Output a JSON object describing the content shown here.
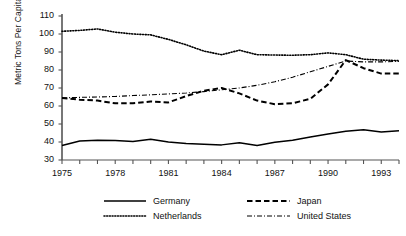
{
  "chart_data": {
    "type": "line",
    "title": "",
    "xlabel": "",
    "ylabel": "Metric Tons Per Capita",
    "xlim": [
      1975,
      1994
    ],
    "ylim": [
      30,
      110
    ],
    "ytick_values": [
      30,
      40,
      50,
      60,
      70,
      80,
      90,
      100,
      110
    ],
    "ytick_labels": [
      "30",
      "40",
      "50",
      "60",
      "70",
      "80",
      "90",
      "100",
      "110"
    ],
    "xtick_values": [
      1975,
      1976,
      1977,
      1978,
      1979,
      1980,
      1981,
      1982,
      1983,
      1984,
      1985,
      1986,
      1987,
      1988,
      1989,
      1990,
      1991,
      1992,
      1993,
      1994
    ],
    "xtick_labels": [
      "1975",
      "",
      "",
      "1978",
      "",
      "",
      "1981",
      "",
      "",
      "1984",
      "",
      "",
      "1987",
      "",
      "",
      "1990",
      "",
      "",
      "1993",
      ""
    ],
    "x": [
      1975,
      1976,
      1977,
      1978,
      1979,
      1980,
      1981,
      1982,
      1983,
      1984,
      1985,
      1986,
      1987,
      1988,
      1989,
      1990,
      1991,
      1992,
      1993,
      1994
    ],
    "grid": false,
    "legend_position": "bottom",
    "series": [
      {
        "name": "Germany",
        "style": "solid",
        "color": "#000000",
        "values": [
          38.0,
          40.5,
          41.0,
          40.8,
          40.3,
          41.5,
          40.0,
          39.2,
          38.7,
          38.4,
          39.6,
          38.0,
          39.8,
          41.0,
          42.8,
          44.5,
          46.0,
          46.8,
          45.5,
          46.2
        ]
      },
      {
        "name": "Netherlands",
        "style": "dotted",
        "color": "#000000",
        "values": [
          101.5,
          102.0,
          102.8,
          101.0,
          100.0,
          99.5,
          97.0,
          94.0,
          90.5,
          88.5,
          91.0,
          88.5,
          88.3,
          88.2,
          88.5,
          89.5,
          88.5,
          86.0,
          85.5,
          85.2
        ]
      },
      {
        "name": "Japan",
        "style": "dashed",
        "color": "#000000",
        "values": [
          64.5,
          63.5,
          63.0,
          61.5,
          61.5,
          62.5,
          62.0,
          65.5,
          68.5,
          70.0,
          67.0,
          63.0,
          61.0,
          61.5,
          64.0,
          72.0,
          85.5,
          81.0,
          78.0,
          78.0
        ]
      },
      {
        "name": "United States",
        "style": "dashdot",
        "color": "#000000",
        "values": [
          64.5,
          64.8,
          65.0,
          65.3,
          65.8,
          66.2,
          66.7,
          67.2,
          68.0,
          69.0,
          70.0,
          71.5,
          73.5,
          76.0,
          79.0,
          82.0,
          85.0,
          84.5,
          84.5,
          84.8
        ]
      }
    ]
  },
  "legend": {
    "entries": [
      {
        "label": "Germany",
        "style": "solid"
      },
      {
        "label": "Netherlands",
        "style": "dotted"
      },
      {
        "label": "Japan",
        "style": "dashed"
      },
      {
        "label": "United States",
        "style": "dashdot"
      }
    ]
  }
}
